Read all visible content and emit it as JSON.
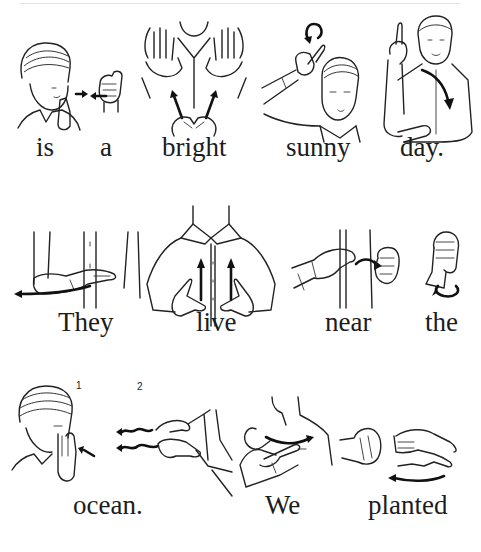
{
  "page": {
    "rows": [
      {
        "words": [
          {
            "text": "is",
            "x": 36,
            "y": 152
          },
          {
            "text": "a",
            "x": 100,
            "y": 152
          },
          {
            "text": "bright",
            "x": 162,
            "y": 152
          },
          {
            "text": "sunny",
            "x": 286,
            "y": 152
          },
          {
            "text": "day.",
            "x": 400,
            "y": 152
          }
        ],
        "signs": [
          "is",
          "a",
          "bright",
          "sunny",
          "day"
        ]
      },
      {
        "words": [
          {
            "text": "They",
            "x": 58,
            "y": 327
          },
          {
            "text": "live",
            "x": 196,
            "y": 327
          },
          {
            "text": "near",
            "x": 325,
            "y": 327
          },
          {
            "text": "the",
            "x": 425,
            "y": 327
          }
        ],
        "signs": [
          "they",
          "live",
          "near",
          "the"
        ]
      },
      {
        "words": [
          {
            "text": "ocean.",
            "x": 73,
            "y": 510
          },
          {
            "text": "We",
            "x": 265,
            "y": 510
          },
          {
            "text": "planted",
            "x": 368,
            "y": 510
          }
        ],
        "signs": [
          "ocean",
          "we",
          "planted"
        ],
        "step_labels": [
          "1",
          "2"
        ]
      }
    ]
  }
}
